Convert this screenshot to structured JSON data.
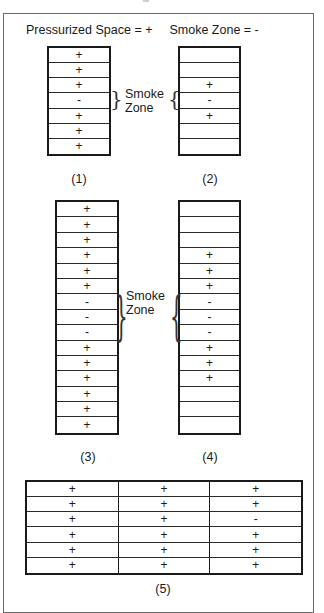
{
  "legend": {
    "pressurized": "Pressurized Space = +",
    "smoke": "Smoke Zone = -"
  },
  "zone_label": {
    "line1": "Smoke",
    "line2": "Zone"
  },
  "symbols": {
    "pressurized": "+",
    "smoke": "-"
  },
  "diagrams": [
    {
      "caption": "(1)",
      "floors": [
        "+",
        "+",
        "+",
        "-",
        "+",
        "+",
        "+"
      ]
    },
    {
      "caption": "(2)",
      "floors": [
        "",
        "",
        "+",
        "-",
        "+",
        "",
        ""
      ]
    },
    {
      "caption": "(3)",
      "floors": [
        "+",
        "+",
        "+",
        "+",
        "+",
        "+",
        "-",
        "-",
        "-",
        "+",
        "+",
        "+",
        "+",
        "+",
        "+"
      ]
    },
    {
      "caption": "(4)",
      "floors": [
        "",
        "",
        "",
        "+",
        "+",
        "+",
        "-",
        "-",
        "-",
        "+",
        "+",
        "+",
        "",
        "",
        ""
      ]
    },
    {
      "caption": "(5)",
      "rows": [
        [
          "+",
          "+",
          "+"
        ],
        [
          "+",
          "+",
          "+"
        ],
        [
          "+",
          "+",
          "-"
        ],
        [
          "+",
          "+",
          "+"
        ],
        [
          "+",
          "+",
          "+"
        ],
        [
          "+",
          "+",
          "+"
        ]
      ]
    }
  ],
  "colors": {
    "line": "#1a1a1a",
    "frame": "#6a6a6a",
    "background": "#ffffff"
  }
}
